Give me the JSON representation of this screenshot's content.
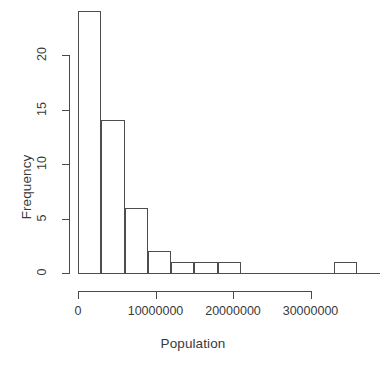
{
  "chart_data": {
    "type": "bar",
    "title": "",
    "subtitle": "",
    "xlabel": "Population",
    "ylabel": "Frequency",
    "grid": false,
    "legend": false,
    "legend_position": "none",
    "xlim": [
      0,
      37000000
    ],
    "ylim": [
      0,
      24
    ],
    "xticks": [
      0,
      10000000,
      20000000,
      30000000
    ],
    "xtick_labels": [
      "0",
      "10000000",
      "20000000",
      "30000000"
    ],
    "yticks": [
      0,
      5,
      10,
      15,
      20
    ],
    "ytick_labels": [
      "0",
      "5",
      "10",
      "15",
      "20"
    ],
    "bin_width": 3000000,
    "bin_edges": [
      0,
      3000000,
      6000000,
      9000000,
      12000000,
      15000000,
      18000000,
      21000000,
      24000000,
      27000000,
      30000000,
      33000000,
      36000000,
      39000000
    ],
    "categories": [
      "0-3M",
      "3M-6M",
      "6M-9M",
      "9M-12M",
      "12M-15M",
      "15M-18M",
      "18M-21M",
      "21M-24M",
      "24M-27M",
      "27M-30M",
      "30M-33M",
      "33M-36M",
      "36M-39M"
    ],
    "values": [
      24,
      14,
      6,
      2,
      1,
      1,
      1,
      0,
      0,
      0,
      0,
      1,
      0
    ],
    "annotations": []
  },
  "axes": {
    "x_title": "Population",
    "y_title": "Frequency"
  },
  "geometry": {
    "note": "pixel mapping used by template",
    "x_zero_px": 78,
    "x_per_10m_px": 77.5,
    "y_zero_px": 273,
    "y_per_unit_px": 10.9,
    "bar_width_px": 23.25,
    "x_axis_line_start_px": 78,
    "x_axis_line_end_px": 310,
    "y_axis_line_top_px": 55,
    "y_axis_line_bottom_px": 273
  }
}
